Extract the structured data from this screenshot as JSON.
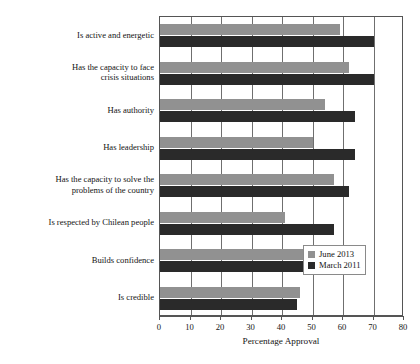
{
  "chart_data": {
    "type": "bar",
    "orientation": "horizontal",
    "title": "",
    "xlabel": "Percentage Approval",
    "ylabel": "",
    "xlim": [
      0,
      80
    ],
    "xticks": [
      0,
      10,
      20,
      30,
      40,
      50,
      60,
      70,
      80
    ],
    "grid": true,
    "legend_position": "bottom-right",
    "categories": [
      "Is active and energetic",
      "Has the capacity to face crisis situations",
      "Has authority",
      "Has leadership",
      "Has the capacity to solve the problems of the country",
      "Is respected by Chilean people",
      "Builds confidence",
      "Is credible"
    ],
    "category_lines": [
      [
        "Is active and energetic"
      ],
      [
        "Has the capacity to face",
        "crisis situations"
      ],
      [
        "Has authority"
      ],
      [
        "Has leadership"
      ],
      [
        "Has the capacity to solve the",
        "problems of the country"
      ],
      [
        "Is respected by Chilean people"
      ],
      [
        "Builds confidence"
      ],
      [
        "Is credible"
      ]
    ],
    "series": [
      {
        "name": "June 2013",
        "color": "#919191",
        "values": [
          59,
          62,
          54,
          50,
          57,
          41,
          47,
          46
        ]
      },
      {
        "name": "March 2011",
        "color": "#2a2a2a",
        "values": [
          70,
          70,
          64,
          64,
          62,
          57,
          47,
          45
        ]
      }
    ]
  },
  "axis": {
    "x_title": "Percentage Approval",
    "tick_labels": [
      "0",
      "10",
      "20",
      "30",
      "40",
      "50",
      "60",
      "70",
      "80"
    ]
  },
  "legend": {
    "items": [
      {
        "label": "June 2013",
        "color": "#919191"
      },
      {
        "label": "March 2011",
        "color": "#2a2a2a"
      }
    ]
  }
}
